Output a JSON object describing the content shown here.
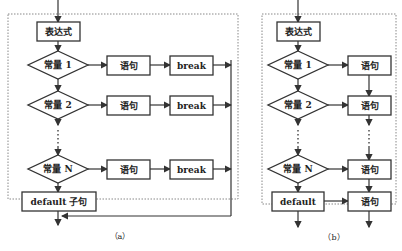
{
  "panel_a": {
    "expression": "表达式",
    "cases": [
      {
        "constant": "常量 1",
        "statement": "语句",
        "break": "break"
      },
      {
        "constant": "常量 2",
        "statement": "语句",
        "break": "break"
      },
      {
        "constant": "常量 N",
        "statement": "语句",
        "break": "break"
      }
    ],
    "default": "default 子句",
    "caption": "（a）"
  },
  "panel_b": {
    "expression": "表达式",
    "cases": [
      {
        "constant": "常量 1",
        "statement": "语句"
      },
      {
        "constant": "常量 2",
        "statement": "语句"
      },
      {
        "constant": "常量 N",
        "statement": "语句"
      }
    ],
    "default": "default",
    "default_statement": "语句",
    "caption": "（b）"
  }
}
